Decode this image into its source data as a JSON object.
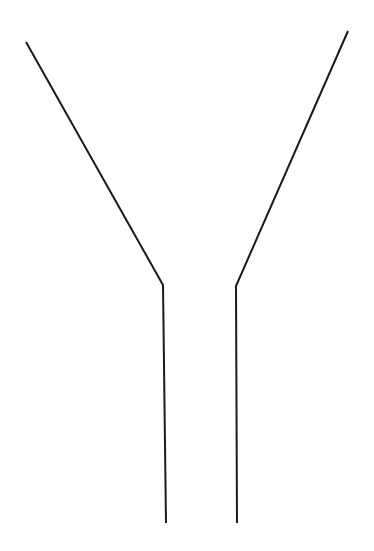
{
  "figure": {
    "stroke_color": "#1a1a1a",
    "stroke_width": 2,
    "background": "#ffffff",
    "left_path": [
      [
        26,
        42
      ],
      [
        163,
        285
      ],
      [
        166,
        523
      ]
    ],
    "right_path": [
      [
        348,
        31
      ],
      [
        236,
        286
      ],
      [
        237,
        523
      ]
    ]
  }
}
